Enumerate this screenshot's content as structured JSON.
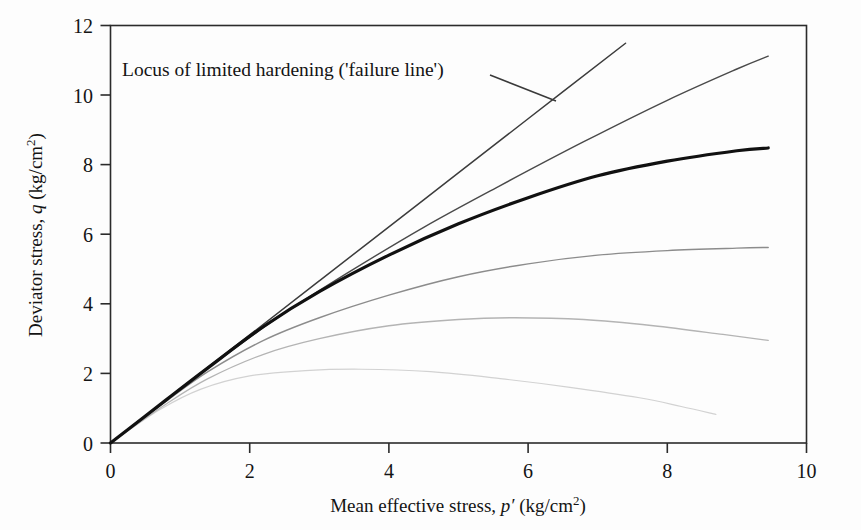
{
  "figure": {
    "background_color": "#fdfdfd",
    "frame_color": "#2b2b2b"
  },
  "annotation": {
    "text": "Locus of limited hardening ('failure line')",
    "leader_from_x": 490,
    "leader_from_y": 75,
    "leader_to_x": 556,
    "leader_to_y": 101
  },
  "chart_data": {
    "type": "line",
    "title": "",
    "xlabel": "Mean effective stress, p' (kg/cm2)",
    "ylabel": "Deviator stress, q (kg/cm2)",
    "xlabel_parts": {
      "prefix": "Mean effective stress, ",
      "symbol": "p",
      "prime": "′",
      "units_open": " (kg/cm",
      "exponent": "2",
      "units_close": ")"
    },
    "ylabel_parts": {
      "prefix": "Deviator stress, ",
      "symbol": "q",
      "units_open": " (kg/cm",
      "exponent": "2",
      "units_close": ")"
    },
    "xlim": [
      0,
      10
    ],
    "ylim": [
      0,
      12
    ],
    "xticks": [
      0,
      2,
      4,
      6,
      8,
      10
    ],
    "yticks": [
      0,
      2,
      4,
      6,
      8,
      10,
      12
    ],
    "xticklabels": [
      "0",
      "2",
      "4",
      "6",
      "8",
      "10"
    ],
    "yticklabels": [
      "0",
      "2",
      "4",
      "6",
      "8",
      "10",
      "12"
    ],
    "grid": false,
    "legend": "none",
    "series": [
      {
        "name": "failure-line",
        "description": "Locus of limited hardening (failure line) - straight line through origin",
        "color": "#3c3c3c",
        "width": 1.5,
        "points": [
          [
            0,
            0
          ],
          [
            1.5,
            2.33
          ],
          [
            3.0,
            4.66
          ],
          [
            4.5,
            6.99
          ],
          [
            6.0,
            9.32
          ],
          [
            7.4,
            11.49
          ]
        ]
      },
      {
        "name": "hardening-curve-1",
        "description": "Uppermost hardening effective stress path, ends near q = 11.1",
        "color": "#4a4a4a",
        "width": 1.4,
        "points": [
          [
            0,
            0
          ],
          [
            0.8,
            1.24
          ],
          [
            1.5,
            2.3
          ],
          [
            2.4,
            3.6
          ],
          [
            3.4,
            4.88
          ],
          [
            4.5,
            6.2
          ],
          [
            5.6,
            7.4
          ],
          [
            6.8,
            8.66
          ],
          [
            8.0,
            9.85
          ],
          [
            9.0,
            10.75
          ],
          [
            9.45,
            11.12
          ]
        ]
      },
      {
        "name": "hardening-curve-2",
        "description": "Bold black curve, ends near q = 8.45",
        "color": "#111111",
        "width": 3.2,
        "points": [
          [
            0,
            0
          ],
          [
            0.8,
            1.24
          ],
          [
            1.4,
            2.16
          ],
          [
            2.2,
            3.35
          ],
          [
            3.0,
            4.35
          ],
          [
            4.0,
            5.4
          ],
          [
            5.0,
            6.3
          ],
          [
            6.0,
            7.05
          ],
          [
            7.0,
            7.68
          ],
          [
            8.0,
            8.1
          ],
          [
            9.0,
            8.4
          ],
          [
            9.45,
            8.48
          ]
        ]
      },
      {
        "name": "hardening-curve-3",
        "description": "Mid-grey curve flattening near q = 5.6",
        "color": "#8c8c8c",
        "width": 1.4,
        "points": [
          [
            0,
            0
          ],
          [
            0.8,
            1.2
          ],
          [
            1.4,
            2.05
          ],
          [
            2.2,
            2.95
          ],
          [
            3.0,
            3.6
          ],
          [
            4.0,
            4.25
          ],
          [
            5.0,
            4.78
          ],
          [
            6.0,
            5.15
          ],
          [
            7.0,
            5.4
          ],
          [
            8.0,
            5.53
          ],
          [
            9.0,
            5.6
          ],
          [
            9.45,
            5.62
          ]
        ]
      },
      {
        "name": "hardening-curve-4",
        "description": "Light grey curve peaking near q = 3.6 then softening to q = 3.0",
        "color": "#b4b4b4",
        "width": 1.3,
        "points": [
          [
            0,
            0
          ],
          [
            0.8,
            1.12
          ],
          [
            1.4,
            1.85
          ],
          [
            2.2,
            2.55
          ],
          [
            3.0,
            3.0
          ],
          [
            4.0,
            3.37
          ],
          [
            5.0,
            3.55
          ],
          [
            5.8,
            3.6
          ],
          [
            6.8,
            3.55
          ],
          [
            7.8,
            3.37
          ],
          [
            8.8,
            3.12
          ],
          [
            9.45,
            2.95
          ]
        ]
      },
      {
        "name": "softening-curve-5",
        "description": "Very faint curve peaking near q = 2.1 at p' = 3.6 then softening",
        "color": "#d2d2d2",
        "width": 1.2,
        "points": [
          [
            0,
            0
          ],
          [
            0.7,
            0.95
          ],
          [
            1.3,
            1.55
          ],
          [
            2.0,
            1.93
          ],
          [
            2.8,
            2.08
          ],
          [
            3.6,
            2.12
          ],
          [
            4.6,
            2.05
          ],
          [
            5.6,
            1.85
          ],
          [
            6.6,
            1.6
          ],
          [
            7.6,
            1.3
          ],
          [
            8.2,
            1.05
          ],
          [
            8.7,
            0.82
          ]
        ]
      }
    ]
  }
}
